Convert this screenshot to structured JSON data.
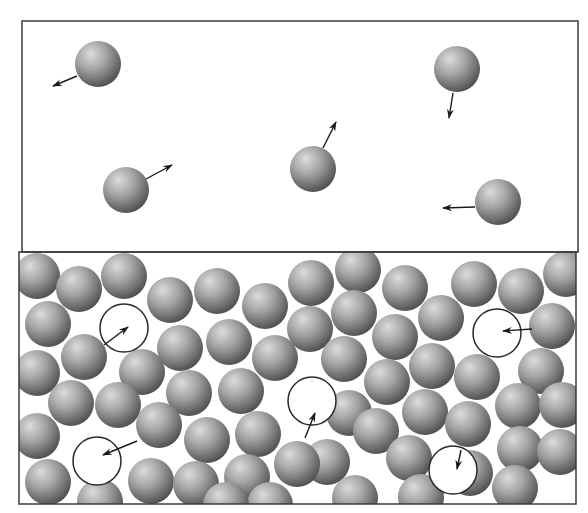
{
  "figure": {
    "width": 588,
    "height": 513,
    "colors": {
      "background": "#ffffff",
      "border": "#3a3a3a",
      "sphere_highlight": "#d8d8d8",
      "sphere_mid": "#9a9a9a",
      "sphere_shadow": "#4a4a4a",
      "arrow": "#1a1a1a",
      "vacancy_outline": "#2a2a2a"
    },
    "particle_radius": 23
  },
  "gas_panel": {
    "label": "gas",
    "frame": {
      "x": 22,
      "y": 21,
      "w": 556,
      "h": 231
    },
    "particles": [
      {
        "cx": 98,
        "cy": 64,
        "ax": 77,
        "ay": 76,
        "bx": 53,
        "by": 86
      },
      {
        "cx": 457,
        "cy": 69,
        "ax": 453,
        "ay": 93,
        "bx": 449,
        "by": 118
      },
      {
        "cx": 313,
        "cy": 169,
        "ax": 323,
        "ay": 148,
        "bx": 336,
        "by": 122
      },
      {
        "cx": 126,
        "cy": 190,
        "ax": 146,
        "ay": 179,
        "bx": 172,
        "by": 165
      },
      {
        "cx": 498,
        "cy": 202,
        "ax": 475,
        "ay": 207,
        "bx": 443,
        "by": 208
      }
    ]
  },
  "liquid_panel": {
    "label": "liquid",
    "frame": {
      "x": 19,
      "y": 252,
      "w": 557,
      "h": 252
    },
    "particles": [
      {
        "cx": 37,
        "cy": 276
      },
      {
        "cx": 79,
        "cy": 289
      },
      {
        "cx": 124,
        "cy": 276
      },
      {
        "cx": 170,
        "cy": 300
      },
      {
        "cx": 217,
        "cy": 291
      },
      {
        "cx": 265,
        "cy": 306
      },
      {
        "cx": 311,
        "cy": 283
      },
      {
        "cx": 358,
        "cy": 270
      },
      {
        "cx": 405,
        "cy": 288
      },
      {
        "cx": 474,
        "cy": 284
      },
      {
        "cx": 521,
        "cy": 291
      },
      {
        "cx": 566,
        "cy": 274
      },
      {
        "cx": 48,
        "cy": 324
      },
      {
        "cx": 310,
        "cy": 329
      },
      {
        "cx": 354,
        "cy": 313
      },
      {
        "cx": 395,
        "cy": 337
      },
      {
        "cx": 441,
        "cy": 318
      },
      {
        "cx": 552,
        "cy": 326
      },
      {
        "cx": 84,
        "cy": 357
      },
      {
        "cx": 180,
        "cy": 348
      },
      {
        "cx": 229,
        "cy": 342
      },
      {
        "cx": 275,
        "cy": 358
      },
      {
        "cx": 344,
        "cy": 359
      },
      {
        "cx": 432,
        "cy": 366
      },
      {
        "cx": 541,
        "cy": 371
      },
      {
        "cx": 37,
        "cy": 373
      },
      {
        "cx": 142,
        "cy": 372
      },
      {
        "cx": 71,
        "cy": 403
      },
      {
        "cx": 118,
        "cy": 405
      },
      {
        "cx": 189,
        "cy": 393
      },
      {
        "cx": 241,
        "cy": 391
      },
      {
        "cx": 387,
        "cy": 382
      },
      {
        "cx": 477,
        "cy": 377
      },
      {
        "cx": 37,
        "cy": 436
      },
      {
        "cx": 159,
        "cy": 425
      },
      {
        "cx": 207,
        "cy": 440
      },
      {
        "cx": 258,
        "cy": 434
      },
      {
        "cx": 349,
        "cy": 413
      },
      {
        "cx": 376,
        "cy": 431
      },
      {
        "cx": 425,
        "cy": 412
      },
      {
        "cx": 468,
        "cy": 424
      },
      {
        "cx": 518,
        "cy": 406
      },
      {
        "cx": 562,
        "cy": 405
      },
      {
        "cx": 327,
        "cy": 462
      },
      {
        "cx": 470,
        "cy": 473
      },
      {
        "cx": 48,
        "cy": 482
      },
      {
        "cx": 151,
        "cy": 481
      },
      {
        "cx": 196,
        "cy": 484
      },
      {
        "cx": 247,
        "cy": 477
      },
      {
        "cx": 297,
        "cy": 464
      },
      {
        "cx": 355,
        "cy": 498
      },
      {
        "cx": 409,
        "cy": 458
      },
      {
        "cx": 520,
        "cy": 449
      },
      {
        "cx": 560,
        "cy": 452
      },
      {
        "cx": 515,
        "cy": 488
      },
      {
        "cx": 421,
        "cy": 497
      },
      {
        "cx": 100,
        "cy": 502
      },
      {
        "cx": 270,
        "cy": 505
      },
      {
        "cx": 226,
        "cy": 505
      }
    ],
    "vacancies": [
      {
        "cx": 124,
        "cy": 328,
        "r": 24,
        "ax": 104,
        "ay": 345,
        "bx": 128,
        "by": 327
      },
      {
        "cx": 497,
        "cy": 333,
        "r": 24,
        "ax": 532,
        "ay": 329,
        "bx": 503,
        "by": 331
      },
      {
        "cx": 312,
        "cy": 401,
        "r": 24,
        "ax": 305,
        "ay": 438,
        "bx": 315,
        "by": 413
      },
      {
        "cx": 97,
        "cy": 461,
        "r": 24,
        "ax": 137,
        "ay": 441,
        "bx": 103,
        "by": 455
      },
      {
        "cx": 453,
        "cy": 470,
        "r": 24,
        "ax": 461,
        "ay": 450,
        "bx": 457,
        "by": 469
      }
    ]
  }
}
